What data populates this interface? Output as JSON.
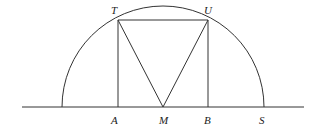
{
  "diagram": {
    "type": "geometry",
    "points": {
      "T": {
        "label": "T",
        "x": 118,
        "y": 20
      },
      "U": {
        "label": "U",
        "x": 208,
        "y": 20
      },
      "A": {
        "label": "A",
        "x": 118,
        "y": 107
      },
      "M": {
        "label": "M",
        "x": 163,
        "y": 107
      },
      "B": {
        "label": "B",
        "x": 208,
        "y": 107
      },
      "S": {
        "label": "S",
        "x": 264,
        "y": 107
      }
    },
    "labels": {
      "T": "T",
      "U": "U",
      "A": "A",
      "M": "M",
      "B": "B",
      "S": "S"
    },
    "segments": [
      "TU",
      "TA",
      "UB",
      "TM",
      "UM"
    ],
    "baseline": {
      "x1": 22,
      "x2": 304,
      "y": 107
    },
    "semicircle": {
      "center": "M",
      "radius": 101
    },
    "stroke_color": "#333333"
  }
}
